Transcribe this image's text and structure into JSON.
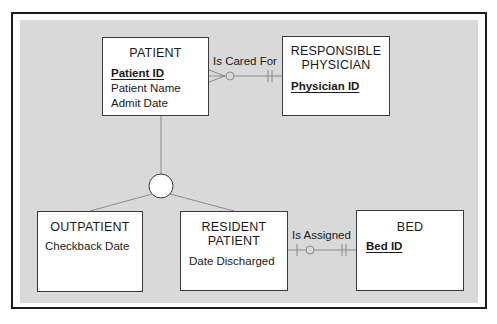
{
  "diagram": {
    "type": "entity-relationship",
    "colors": {
      "background": "#ffffff",
      "frame": "#1c1c1c",
      "panel": "#d9d9d9",
      "entity_fill": "#ffffff",
      "line": "#8a8a8a"
    },
    "entities": [
      {
        "id": "patient",
        "name": "PATIENT",
        "attributes": [
          {
            "label": "Patient ID",
            "key": true
          },
          {
            "label": "Patient Name",
            "key": false
          },
          {
            "label": "Admit Date",
            "key": false
          }
        ]
      },
      {
        "id": "responsible_physician",
        "name_lines": [
          "RESPONSIBLE",
          "PHYSICIAN"
        ],
        "attributes": [
          {
            "label": "Physician ID",
            "key": true
          }
        ]
      },
      {
        "id": "outpatient",
        "name": "OUTPATIENT",
        "attributes": [
          {
            "label": "Checkback Date",
            "key": false
          }
        ]
      },
      {
        "id": "resident_patient",
        "name_lines": [
          "RESIDENT",
          "PATIENT"
        ],
        "attributes": [
          {
            "label": "Date Discharged",
            "key": false
          }
        ]
      },
      {
        "id": "bed",
        "name": "BED",
        "attributes": [
          {
            "label": "Bed ID",
            "key": true
          }
        ]
      }
    ],
    "relationships": [
      {
        "label": "Is Cared For",
        "from": "PATIENT",
        "to": "RESPONSIBLE PHYSICIAN",
        "from_cardinality": "zero-or-many",
        "to_cardinality": "exactly-one"
      },
      {
        "label": "Is Assigned",
        "from": "RESIDENT PATIENT",
        "to": "BED",
        "from_cardinality": "zero-or-one",
        "to_cardinality": "exactly-one"
      }
    ],
    "generalization": {
      "supertype": "PATIENT",
      "subtypes": [
        "OUTPATIENT",
        "RESIDENT PATIENT"
      ],
      "symbol": "circle"
    }
  }
}
